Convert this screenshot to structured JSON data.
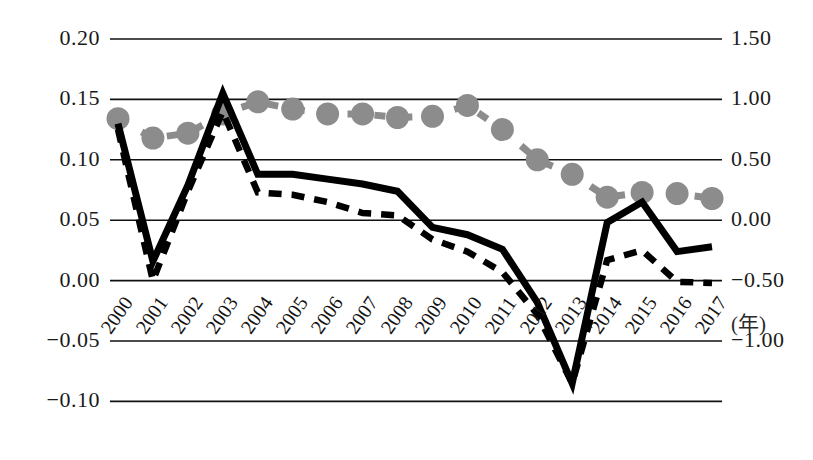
{
  "chart_data": {
    "type": "line",
    "title": "",
    "xlabel": "(年)",
    "ylabel": "",
    "grid": true,
    "legend": "none",
    "x": [
      2000,
      2001,
      2002,
      2003,
      2004,
      2005,
      2006,
      2007,
      2008,
      2009,
      2010,
      2011,
      2012,
      2013,
      2014,
      2015,
      2016,
      2017
    ],
    "xtick_labels": [
      "2000",
      "2001",
      "2002",
      "2003",
      "2004",
      "2005",
      "2006",
      "2007",
      "2008",
      "2009",
      "2010",
      "2011",
      "2012",
      "2013",
      "2014",
      "2015",
      "2016",
      "2017"
    ],
    "left_axis": {
      "ticks": [
        "0.20",
        "0.15",
        "0.10",
        "0.05",
        "0.00",
        "-0.05",
        "-0.10"
      ],
      "values": [
        0.2,
        0.15,
        0.1,
        0.05,
        0.0,
        -0.05,
        -0.1
      ],
      "ylim": [
        -0.1,
        0.2
      ]
    },
    "right_axis": {
      "ticks": [
        "1.50",
        "1.00",
        "0.50",
        "0.00",
        "-0.50",
        "-1.00"
      ],
      "values": [
        1.5,
        1.0,
        0.5,
        0.0,
        -0.5,
        -1.0
      ],
      "ylim": [
        -1.5,
        1.5
      ]
    },
    "series": [
      {
        "name": "solid-line-series",
        "style": "solid",
        "color": "#000000",
        "axis": "left",
        "values": [
          0.13,
          0.016,
          0.079,
          0.155,
          0.088,
          0.088,
          0.084,
          0.08,
          0.074,
          0.044,
          0.038,
          0.026,
          -0.018,
          -0.085,
          0.048,
          0.065,
          0.024,
          0.028
        ]
      },
      {
        "name": "dashed-line-series",
        "style": "dashed",
        "color": "#000000",
        "axis": "left",
        "values": [
          0.125,
          0.0,
          0.074,
          0.14,
          0.073,
          0.071,
          0.065,
          0.056,
          0.054,
          0.034,
          0.024,
          0.007,
          -0.028,
          -0.085,
          0.017,
          0.025,
          -0.001,
          -0.002
        ]
      },
      {
        "name": "marker-dashed-series",
        "style": "dashed-with-round-markers",
        "color": "#8c8c8c",
        "axis": "right",
        "values": [
          0.84,
          0.68,
          0.72,
          0.88,
          0.98,
          0.92,
          0.88,
          0.88,
          0.85,
          0.86,
          0.95,
          0.75,
          0.5,
          0.38,
          0.19,
          0.23,
          0.22,
          0.18
        ]
      }
    ]
  }
}
